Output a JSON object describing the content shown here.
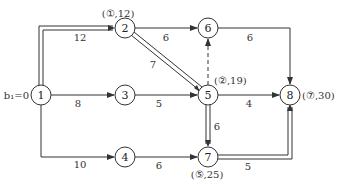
{
  "diagram": {
    "type": "network-shortest-path",
    "start_label": "b₁=0",
    "nodes": [
      {
        "id": "1",
        "label": "1",
        "x": 41,
        "y": 95
      },
      {
        "id": "2",
        "label": "2",
        "x": 125,
        "y": 28,
        "annotation": "(①,12)"
      },
      {
        "id": "3",
        "label": "3",
        "x": 125,
        "y": 95
      },
      {
        "id": "4",
        "label": "4",
        "x": 125,
        "y": 157
      },
      {
        "id": "5",
        "label": "5",
        "x": 208,
        "y": 95,
        "annotation": "(②,19)"
      },
      {
        "id": "6",
        "label": "6",
        "x": 208,
        "y": 28
      },
      {
        "id": "7",
        "label": "7",
        "x": 208,
        "y": 157,
        "annotation": "(⑤,25)"
      },
      {
        "id": "8",
        "label": "8",
        "x": 290,
        "y": 95,
        "annotation": "(⑦,30)"
      }
    ],
    "edges": [
      {
        "from": "1",
        "to": "2",
        "weight": "12",
        "highlighted": true
      },
      {
        "from": "1",
        "to": "3",
        "weight": "8"
      },
      {
        "from": "1",
        "to": "4",
        "weight": "10"
      },
      {
        "from": "2",
        "to": "6",
        "weight": "6"
      },
      {
        "from": "2",
        "to": "5",
        "weight": "7",
        "highlighted": true
      },
      {
        "from": "3",
        "to": "5",
        "weight": "5"
      },
      {
        "from": "4",
        "to": "7",
        "weight": "6"
      },
      {
        "from": "5",
        "to": "6",
        "weight": "",
        "dashed": true
      },
      {
        "from": "5",
        "to": "8",
        "weight": "4"
      },
      {
        "from": "5",
        "to": "7",
        "weight": "6",
        "highlighted": true
      },
      {
        "from": "6",
        "to": "8",
        "weight": "6"
      },
      {
        "from": "7",
        "to": "8",
        "weight": "5",
        "highlighted": true
      }
    ]
  },
  "labels": {
    "start": "b₁=0",
    "n1": "1",
    "n2": "2",
    "n3": "3",
    "n4": "4",
    "n5": "5",
    "n6": "6",
    "n7": "7",
    "n8": "8",
    "ann2": "(①,12)",
    "ann5": "(②,19)",
    "ann7": "(⑤,25)",
    "ann8": "(⑦,30)",
    "w12": "12",
    "w13": "8",
    "w14": "10",
    "w26": "6",
    "w25": "7",
    "w35": "5",
    "w47": "6",
    "w58": "4",
    "w57": "6",
    "w68": "6",
    "w78": "5"
  }
}
